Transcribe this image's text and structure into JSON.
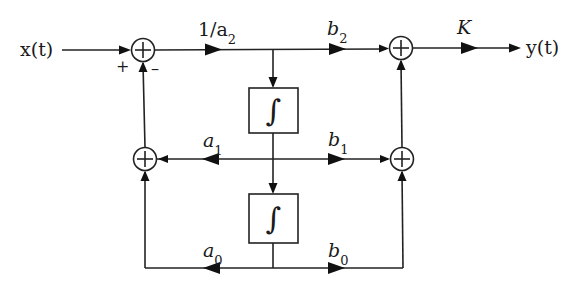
{
  "diagram": {
    "type": "block-diagram",
    "signals": {
      "input": "x(t)",
      "output": "y(t)"
    },
    "gains": {
      "forward": "1/a",
      "forward_sub": "2",
      "b2": "b",
      "b2_sub": "2",
      "b1": "b",
      "b1_sub": "1",
      "b0": "b",
      "b0_sub": "0",
      "a1": "a",
      "a1_sub": "1",
      "a0": "a",
      "a0_sub": "0",
      "output_gain": "K"
    },
    "summers": {
      "symbol": "+",
      "input_sign_plus": "+",
      "input_sign_minus": "–"
    },
    "integrators": {
      "symbol": "∫"
    },
    "colors": {
      "line": "#222222",
      "background": "#ffffff"
    }
  }
}
